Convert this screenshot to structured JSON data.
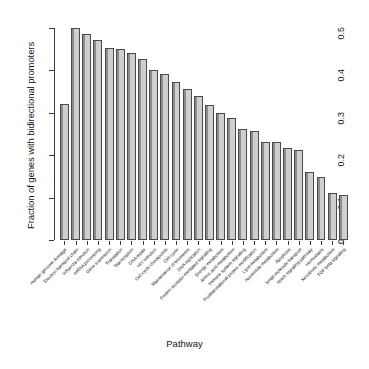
{
  "chart_data": {
    "type": "bar",
    "title": "",
    "xlabel": "Pathway",
    "ylabel": "Fraction of genes with bidirectional promoters",
    "ylim": [
      0.0,
      0.5
    ],
    "yticks": [
      "0",
      "0.1",
      "0.2",
      "0.3",
      "0.4",
      "0.5"
    ],
    "ytick_values": [
      0.0,
      0.1,
      0.2,
      0.3,
      0.4,
      0.5
    ],
    "grid": false,
    "legend": false,
    "bar_fill_color": "#cfcfcf",
    "bar_border_color": "#4a4a4a",
    "categories": [
      "Human genome Average",
      "Electron transport chain",
      "Influenza infection",
      "mRNA processing",
      "Gene expression",
      "Translation",
      "Transcription",
      "DNA repair",
      "HIV infection",
      "Cell cycle checkpoints",
      "Cell cycle",
      "Maintenance of telomeres",
      "DNA replication",
      "Protein receptor-mediated signaling",
      "Energy metabolism",
      "Amino acid metabolism",
      "Immune system signaling",
      "Posttranslational protein modification",
      "Lipid metabolism",
      "Nucleotide metabolism",
      "Apoptosis",
      "Small molecule transport",
      "Notch signaling pathway",
      "Hemostasis",
      "Xenobiotic metabolism",
      "TGF beta signaling"
    ],
    "values": [
      0.32,
      0.5,
      0.485,
      0.472,
      0.452,
      0.45,
      0.441,
      0.428,
      0.401,
      0.392,
      0.373,
      0.357,
      0.34,
      0.318,
      0.3,
      0.287,
      0.262,
      0.258,
      0.232,
      0.231,
      0.216,
      0.212,
      0.16,
      0.148,
      0.11,
      0.105
    ]
  }
}
